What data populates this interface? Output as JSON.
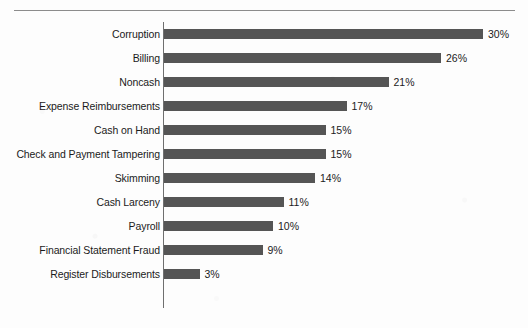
{
  "chart_data": {
    "type": "bar",
    "orientation": "horizontal",
    "title": "",
    "xlabel": "",
    "ylabel": "",
    "grid": false,
    "legend": null,
    "value_suffix": "%",
    "xlim": [
      0,
      30
    ],
    "categories": [
      "Corruption",
      "Billing",
      "Noncash",
      "Expense Reimbursements",
      "Cash on Hand",
      "Check and Payment Tampering",
      "Skimming",
      "Cash Larceny",
      "Payroll",
      "Financial Statement Fraud",
      "Register Disbursements"
    ],
    "values": [
      30,
      26,
      21,
      17,
      15,
      15,
      14,
      11,
      10,
      9,
      3
    ],
    "value_labels": [
      "30%",
      "26%",
      "21%",
      "17%",
      "15%",
      "15%",
      "14%",
      "11%",
      "10%",
      "9%",
      "3%"
    ],
    "colors": {
      "bar": "#555555",
      "text": "#1b1b1b",
      "axis": "#6f6f6f",
      "rule": "#8c8c8c",
      "background": "#fdfdfd"
    }
  }
}
